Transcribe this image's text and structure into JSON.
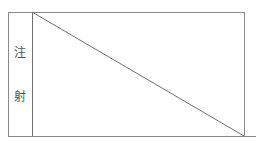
{
  "diagram": {
    "left_column_label": [
      "注",
      "射"
    ],
    "colors": {
      "line": "#8a8a8a",
      "text": "#555555",
      "background": "#ffffff"
    },
    "geometry": {
      "outer_box": {
        "left": 8,
        "top": 12,
        "right": 244,
        "bottom": 136
      },
      "divider_x": 32,
      "diagonal": {
        "x1": 32,
        "y1": 12,
        "x2": 244,
        "y2": 136
      },
      "baseline_extends_to_x": 256
    }
  }
}
